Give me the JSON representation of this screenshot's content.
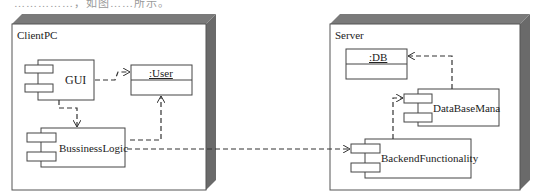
{
  "caption": "……………，如图……所示。",
  "nodes": [
    {
      "name": "ClientPC",
      "components": [
        "GUI",
        "BussinessLogic"
      ],
      "objects": [
        ":User"
      ]
    },
    {
      "name": "Server",
      "components": [
        "DataBaseMana",
        "BackendFunctionality"
      ],
      "objects": [
        ":DB"
      ]
    }
  ],
  "client": {
    "title": "ClientPC",
    "gui": "GUI",
    "logic": "BussinessLogic",
    "user": ":User"
  },
  "server": {
    "title": "Server",
    "db": ":DB",
    "dbmana": "DataBaseMana",
    "backend": "BackendFunctionality"
  },
  "dependencies": [
    {
      "from": "GUI",
      "to": ":User"
    },
    {
      "from": "GUI",
      "to": "BussinessLogic"
    },
    {
      "from": "BussinessLogic",
      "to": ":User"
    },
    {
      "from": "BussinessLogic",
      "to": "BackendFunctionality"
    },
    {
      "from": "BackendFunctionality",
      "to": "DataBaseMana"
    },
    {
      "from": "DataBaseMana",
      "to": ":DB"
    }
  ]
}
